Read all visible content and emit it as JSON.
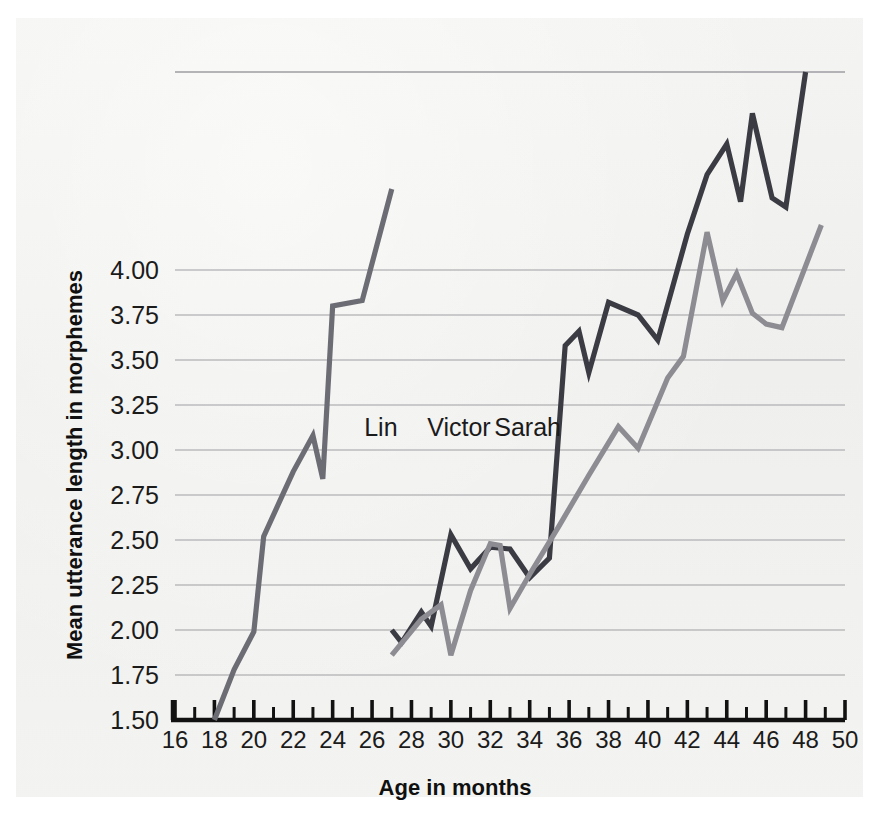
{
  "chart_data": {
    "type": "line",
    "title": "",
    "xlabel": "Age in months",
    "ylabel": "Mean utterance length in morphemes",
    "xlim": [
      16,
      50
    ],
    "ylim": [
      1.5,
      5.1
    ],
    "xticks": [
      16,
      18,
      20,
      22,
      24,
      26,
      28,
      30,
      32,
      34,
      36,
      38,
      40,
      42,
      44,
      46,
      48,
      50
    ],
    "xtick_labels": [
      "16",
      "18",
      "20",
      "22",
      "24",
      "26",
      "28",
      "30",
      "32",
      "34",
      "36",
      "38",
      "40",
      "42",
      "44",
      "46",
      "48",
      "50"
    ],
    "x_minor_tick_step": 1,
    "yticks": [
      1.5,
      1.75,
      2.0,
      2.25,
      2.5,
      2.75,
      3.0,
      3.25,
      3.5,
      3.75,
      4.0
    ],
    "ytick_labels": [
      "1.50",
      "1.75",
      "2.00",
      "2.25",
      "2.50",
      "2.75",
      "3.00",
      "3.25",
      "3.50",
      "3.75",
      "4.00"
    ],
    "grid": "horizontal",
    "grid_color": "#a9a9ad",
    "legend": "inline-labels",
    "series": [
      {
        "name": "Lin",
        "color": "#6c6c74",
        "label_x": 25.6,
        "label_y": 3.08,
        "points": [
          {
            "x": 18.0,
            "y": 1.5
          },
          {
            "x": 19.0,
            "y": 1.78
          },
          {
            "x": 20.0,
            "y": 1.99
          },
          {
            "x": 20.5,
            "y": 2.52
          },
          {
            "x": 21.5,
            "y": 2.76
          },
          {
            "x": 22.0,
            "y": 2.88
          },
          {
            "x": 23.0,
            "y": 3.08
          },
          {
            "x": 23.5,
            "y": 2.84
          },
          {
            "x": 24.0,
            "y": 3.8
          },
          {
            "x": 25.5,
            "y": 3.83
          },
          {
            "x": 27.0,
            "y": 4.45
          }
        ]
      },
      {
        "name": "Victor",
        "color": "#3b3b44",
        "label_x": 28.8,
        "label_y": 3.08,
        "points": [
          {
            "x": 27.0,
            "y": 2.0
          },
          {
            "x": 27.5,
            "y": 1.93
          },
          {
            "x": 28.5,
            "y": 2.1
          },
          {
            "x": 29.0,
            "y": 2.02
          },
          {
            "x": 30.0,
            "y": 2.53
          },
          {
            "x": 31.0,
            "y": 2.34
          },
          {
            "x": 32.0,
            "y": 2.46
          },
          {
            "x": 33.0,
            "y": 2.45
          },
          {
            "x": 34.0,
            "y": 2.29
          },
          {
            "x": 35.0,
            "y": 2.4
          },
          {
            "x": 35.8,
            "y": 3.58
          },
          {
            "x": 36.5,
            "y": 3.66
          },
          {
            "x": 37.0,
            "y": 3.43
          },
          {
            "x": 38.0,
            "y": 3.82
          },
          {
            "x": 39.5,
            "y": 3.75
          },
          {
            "x": 40.5,
            "y": 3.61
          },
          {
            "x": 42.0,
            "y": 4.2
          },
          {
            "x": 43.0,
            "y": 4.53
          },
          {
            "x": 44.0,
            "y": 4.7
          },
          {
            "x": 44.7,
            "y": 4.38
          },
          {
            "x": 45.3,
            "y": 4.87
          },
          {
            "x": 46.3,
            "y": 4.4
          },
          {
            "x": 47.0,
            "y": 4.35
          },
          {
            "x": 48.0,
            "y": 5.1
          }
        ]
      },
      {
        "name": "Sarah",
        "color": "#8c8c92",
        "label_x": 32.2,
        "label_y": 3.08,
        "points": [
          {
            "x": 27.0,
            "y": 1.86
          },
          {
            "x": 28.5,
            "y": 2.06
          },
          {
            "x": 29.5,
            "y": 2.14
          },
          {
            "x": 30.0,
            "y": 1.86
          },
          {
            "x": 31.0,
            "y": 2.22
          },
          {
            "x": 32.0,
            "y": 2.48
          },
          {
            "x": 32.5,
            "y": 2.47
          },
          {
            "x": 33.0,
            "y": 2.12
          },
          {
            "x": 34.0,
            "y": 2.31
          },
          {
            "x": 35.5,
            "y": 2.58
          },
          {
            "x": 37.0,
            "y": 2.86
          },
          {
            "x": 38.5,
            "y": 3.13
          },
          {
            "x": 39.5,
            "y": 3.01
          },
          {
            "x": 41.0,
            "y": 3.4
          },
          {
            "x": 41.8,
            "y": 3.52
          },
          {
            "x": 43.0,
            "y": 4.21
          },
          {
            "x": 43.8,
            "y": 3.83
          },
          {
            "x": 44.5,
            "y": 3.98
          },
          {
            "x": 45.3,
            "y": 3.76
          },
          {
            "x": 46.0,
            "y": 3.7
          },
          {
            "x": 46.8,
            "y": 3.68
          },
          {
            "x": 48.8,
            "y": 4.25
          }
        ]
      }
    ]
  }
}
